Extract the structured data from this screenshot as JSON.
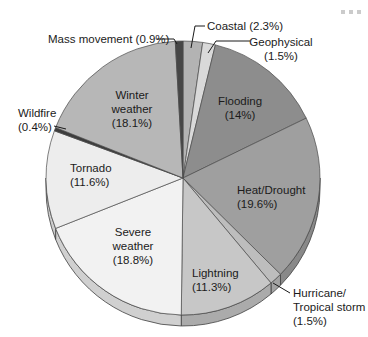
{
  "figure": {
    "background": "#ffffff",
    "text_color": "#1b1b1b"
  },
  "chart_data": {
    "type": "pie",
    "title": "",
    "unit": "percent",
    "total": 100.0,
    "direction": "clockwise",
    "start_angle_deg": 0,
    "style": "3d",
    "slices": [
      {
        "id": "coastal",
        "label": "Coastal",
        "value": 2.3,
        "color": "#b3b3b3"
      },
      {
        "id": "geophysical",
        "label": "Geophysical",
        "value": 1.5,
        "color": "#d9d9d9"
      },
      {
        "id": "flooding",
        "label": "Flooding",
        "value": 14,
        "color": "#8d8d8d"
      },
      {
        "id": "heat-drought",
        "label": "Heat/Drought",
        "value": 19.6,
        "color": "#9f9f9f"
      },
      {
        "id": "hurricane",
        "label": "Hurricane/Tropical storm",
        "value": 1.5,
        "color": "#bdbdbd"
      },
      {
        "id": "lightning",
        "label": "Lightning",
        "value": 11.3,
        "color": "#c7c7c7"
      },
      {
        "id": "severe-weather",
        "label": "Severe weather",
        "value": 18.8,
        "color": "#f2f2f2"
      },
      {
        "id": "tornado",
        "label": "Tornado",
        "value": 11.6,
        "color": "#ededed"
      },
      {
        "id": "wildfire",
        "label": "Wildfire",
        "value": 0.4,
        "color": "#3d3d3d"
      },
      {
        "id": "winter-weather",
        "label": "Winter weather",
        "value": 18.1,
        "color": "#b7b7b7"
      },
      {
        "id": "mass-movement",
        "label": "Mass movement",
        "value": 0.9,
        "color": "#464646"
      }
    ]
  },
  "geometry": {
    "cx": 183,
    "cy": 178,
    "r": 137,
    "depth": 11,
    "slice_stroke": "#4a4a4a",
    "rim_shade_factor": 0.86,
    "leader_stroke": "#1a1a1a"
  },
  "labels": [
    {
      "id": "mass-movement",
      "lines": [
        "Mass movement (0.9%)"
      ],
      "x": 48,
      "y": 32,
      "align": "left",
      "leader": [
        [
          157,
          39
        ],
        [
          174,
          39
        ],
        [
          177,
          44
        ]
      ]
    },
    {
      "id": "coastal",
      "lines": [
        "Coastal (2.3%)"
      ],
      "x": 207,
      "y": 19,
      "align": "left",
      "leader": [
        [
          205,
          26
        ],
        [
          195,
          26
        ],
        [
          191,
          48
        ]
      ]
    },
    {
      "id": "geophysical",
      "lines": [
        "Geophysical",
        "(1.5%)"
      ],
      "x": 281,
      "y": 35,
      "align": "center",
      "leader": [
        [
          250,
          41
        ],
        [
          216,
          41
        ],
        [
          208,
          53
        ]
      ]
    },
    {
      "id": "wildfire",
      "lines": [
        "Wildfire",
        "(0.4%)"
      ],
      "x": 18,
      "y": 106,
      "align": "left",
      "leader": [
        [
          54,
          126
        ],
        [
          66,
          129
        ]
      ]
    },
    {
      "id": "hurricane",
      "lines": [
        "Hurricane/",
        "Tropical storm",
        "(1.5%)"
      ],
      "x": 293,
      "y": 286,
      "align": "left",
      "leader": [
        [
          290,
          293
        ],
        [
          273,
          283
        ]
      ]
    },
    {
      "id": "winter-weather",
      "lines": [
        "Winter",
        "weather",
        "(18.1%)"
      ],
      "x": 132,
      "y": 88,
      "align": "center"
    },
    {
      "id": "flooding",
      "lines": [
        "Flooding",
        "(14%)"
      ],
      "x": 240,
      "y": 94,
      "align": "center"
    },
    {
      "id": "tornado",
      "lines": [
        "Tornado",
        "(11.6%)"
      ],
      "x": 70,
      "y": 161,
      "align": "left"
    },
    {
      "id": "heat-drought",
      "lines": [
        "Heat/Drought",
        "(19.6%)"
      ],
      "x": 237,
      "y": 183,
      "align": "left"
    },
    {
      "id": "severe-weather",
      "lines": [
        "Severe",
        "weather",
        "(18.8%)"
      ],
      "x": 133,
      "y": 225,
      "align": "center"
    },
    {
      "id": "lightning",
      "lines": [
        "Lightning",
        "(11.3%)"
      ],
      "x": 192,
      "y": 266,
      "align": "left"
    }
  ]
}
